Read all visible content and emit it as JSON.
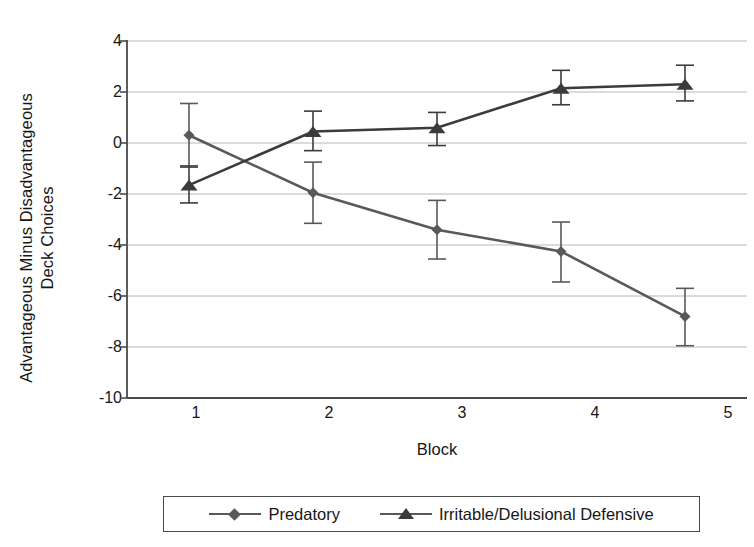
{
  "chart_data": {
    "type": "line",
    "title": "",
    "xlabel": "Block",
    "ylabel": "Advantageous Minus Disadvantageous Deck Choices",
    "ylabel_line1": "Advantageous Minus Disadvantageous",
    "ylabel_line2": "Deck Choices",
    "categories": [
      "1",
      "2",
      "3",
      "4",
      "5"
    ],
    "x": [
      1,
      2,
      3,
      4,
      5
    ],
    "xlim": [
      0.5,
      5.5
    ],
    "ylim": [
      -10,
      4
    ],
    "yticks": [
      "4",
      "2",
      "0",
      "-2",
      "-4",
      "-6",
      "-8",
      "-10"
    ],
    "ytick_values": [
      4,
      2,
      0,
      -2,
      -4,
      -6,
      -8,
      -10
    ],
    "grid": "horizontal",
    "legend_position": "bottom",
    "series": [
      {
        "name": "Predatory",
        "marker": "diamond",
        "color": "#595959",
        "values": [
          0.3,
          -1.95,
          -3.4,
          -4.25,
          -6.8
        ],
        "err_upper": [
          1.25,
          1.2,
          1.15,
          1.15,
          1.1
        ],
        "err_lower": [
          1.25,
          1.2,
          1.15,
          1.2,
          1.15
        ]
      },
      {
        "name": "Irritable/Delusional Defensive",
        "marker": "triangle",
        "color": "#3b3b3b",
        "values": [
          -1.65,
          0.45,
          0.6,
          2.15,
          2.3
        ],
        "err_upper": [
          0.75,
          0.8,
          0.6,
          0.7,
          0.75
        ],
        "err_lower": [
          0.7,
          0.75,
          0.7,
          0.65,
          0.65
        ]
      }
    ]
  },
  "axes": {
    "x_tick_labels": [
      "1",
      "2",
      "3",
      "4",
      "5"
    ],
    "y_tick_labels": [
      "4",
      "2",
      "0",
      "-2",
      "-4",
      "-6",
      "-8",
      "-10"
    ]
  },
  "legend": {
    "items": [
      {
        "label": "Predatory",
        "marker": "diamond"
      },
      {
        "label": "Irritable/Delusional Defensive",
        "marker": "triangle"
      }
    ]
  },
  "colors": {
    "series_predatory": "#595959",
    "series_irritable": "#3b3b3b",
    "gridline": "#b8b8b8",
    "axis": "#4a4a4a",
    "text": "#161616",
    "background": "#ffffff"
  }
}
